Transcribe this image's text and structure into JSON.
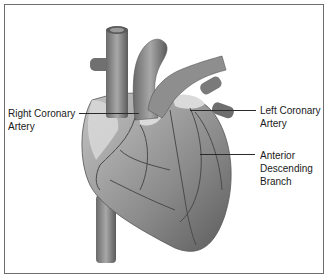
{
  "diagram": {
    "labels": [
      {
        "id": "right-coronary-artery",
        "line1": "Right Coronary",
        "line2": "Artery"
      },
      {
        "id": "left-coronary-artery",
        "line1": "Left Coronary",
        "line2": "Artery"
      },
      {
        "id": "anterior-descending-branch",
        "line1": "Anterior",
        "line2": "Descending",
        "line3": "Branch"
      }
    ],
    "colors": {
      "border": "#6e6e6e",
      "text": "#1a1a1a",
      "heart_light": "#b5b5b5",
      "heart_mid": "#8c8c8c",
      "heart_dark": "#5a5a5a",
      "fat": "#dcdcdc"
    }
  }
}
